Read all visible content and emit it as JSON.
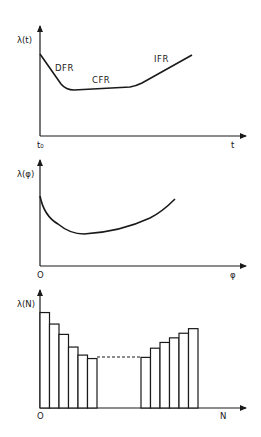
{
  "chart_data": [
    {
      "type": "line",
      "title": "Bathtub curve - failure rate vs time",
      "ylabel": "λ(t)",
      "xlabel": "t",
      "x_origin_label": "t₀",
      "annotations": [
        "DFR",
        "CFR",
        "IFR"
      ],
      "grid": false,
      "series": [
        {
          "name": "λ(t)",
          "x": [
            0,
            0.08,
            0.17,
            0.4,
            0.6,
            0.8,
            0.95
          ],
          "values": [
            0.68,
            0.45,
            0.3,
            0.31,
            0.35,
            0.55,
            0.72
          ]
        }
      ]
    },
    {
      "type": "line",
      "title": "Failure rate vs φ",
      "ylabel": "λ(φ)",
      "xlabel": "φ",
      "x_origin_label": "O",
      "grid": false,
      "series": [
        {
          "name": "λ(φ)",
          "x": [
            0,
            0.05,
            0.22,
            0.45,
            0.7,
            0.85
          ],
          "values": [
            0.58,
            0.4,
            0.3,
            0.36,
            0.51,
            0.65
          ]
        }
      ]
    },
    {
      "type": "bar",
      "title": "Discrete failure rate vs N",
      "ylabel": "λ(N)",
      "xlabel": "N",
      "x_origin_label": "O",
      "grid": false,
      "categories": [
        "1",
        "2",
        "3",
        "4",
        "5",
        "6",
        "…",
        "N-5",
        "N-4",
        "N-3",
        "N-2",
        "N-1",
        "N"
      ],
      "values": [
        0.83,
        0.73,
        0.64,
        0.53,
        0.46,
        0.43,
        null,
        0.44,
        0.52,
        0.57,
        0.61,
        0.65,
        0.69
      ],
      "gap_style": "dashed line connecting bar 6 to bar N-5"
    }
  ],
  "labels": {
    "top": {
      "y": "λ(t)",
      "x": "t",
      "origin": "t₀",
      "dfr": "DFR",
      "cfr": "CFR",
      "ifr": "IFR"
    },
    "middle": {
      "y": "λ(φ)",
      "x": "φ",
      "origin": "O"
    },
    "bottom": {
      "y": "λ(N)",
      "x": "N",
      "origin": "O"
    }
  }
}
